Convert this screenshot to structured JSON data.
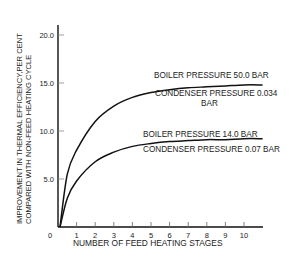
{
  "chart_data": {
    "type": "line",
    "title": "",
    "xlabel": "NUMBER OF FEED HEATING STAGES",
    "ylabel_line1": "IMPROVEMENT IN THERMAL EFFICIENCY,PER CENT",
    "ylabel_line2": "COMPARED WITH NON-FEED HEATING CYCLE",
    "xlim": [
      0,
      11
    ],
    "ylim": [
      0,
      20
    ],
    "x_ticks": [
      1,
      2,
      3,
      4,
      5,
      6,
      7,
      8,
      9,
      10
    ],
    "x_tick_labels": [
      "1",
      "2",
      "3",
      "4",
      "5",
      "6",
      "7",
      "8",
      "9",
      "10"
    ],
    "y_ticks": [
      0,
      5,
      10,
      15,
      20
    ],
    "y_tick_labels": [
      "0",
      "5.0",
      "10.0",
      "15.0",
      "20.0"
    ],
    "grid": false,
    "x": [
      0,
      0.5,
      1,
      2,
      3,
      4,
      5,
      6,
      7,
      8,
      9,
      10,
      11
    ],
    "series": [
      {
        "name": "Boiler pressure 50.0 bar / Condenser pressure 0.034 bar",
        "label_line1": "BOILER PRESSURE 50.0 BAR",
        "label_line2": "CONDENSER PRESSURE 0.034",
        "label_line3": "BAR",
        "values": [
          0,
          5.5,
          8.0,
          11.0,
          12.6,
          13.5,
          14.0,
          14.3,
          14.5,
          14.6,
          14.7,
          14.8,
          14.8
        ]
      },
      {
        "name": "Boiler pressure 14.0 bar / Condenser pressure 0.07 bar",
        "label_line1": "BOILER PRESSURE 14.0 BAR",
        "label_line2": "CONDENSER PRESSURE 0.07 BAR",
        "values": [
          0,
          3.0,
          4.8,
          6.8,
          7.8,
          8.4,
          8.7,
          8.9,
          9.0,
          9.1,
          9.1,
          9.2,
          9.2
        ]
      }
    ]
  },
  "colors": {
    "line": "#111111",
    "text": "#222222",
    "background": "#ffffff"
  }
}
